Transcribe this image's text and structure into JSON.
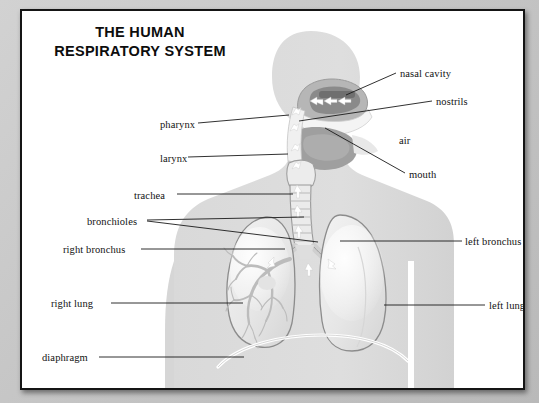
{
  "title": {
    "line1": "THE HUMAN",
    "line2": "RESPIRATORY SYSTEM"
  },
  "diagram": {
    "silhouette": "grey human head-and-torso figure facing right",
    "colors": {
      "frame_border": "#151515",
      "page_background": "#ffffff",
      "outer_margin": "#c9c9c9",
      "body_silhouette": "#dcdcdc",
      "organ_fill": "#eeeeee",
      "organ_outline": "#8c8c8c",
      "nasal_cavity_dark": "#8a8a8a",
      "leader_line": "#1a1a1a",
      "airflow_arrow": "#ffffff",
      "label_text": "#121212",
      "title_text": "#0d0d0d"
    }
  },
  "labels": {
    "left": [
      {
        "name": "pharynx",
        "text": "pharynx",
        "x": 138,
        "y": 115
      },
      {
        "name": "larynx",
        "text": "larynx",
        "x": 138,
        "y": 149
      },
      {
        "name": "trachea",
        "text": "trachea",
        "x": 118,
        "y": 186
      },
      {
        "name": "bronchioles",
        "text": "bronchioles",
        "x": 74,
        "y": 215
      },
      {
        "name": "right-bronchus",
        "text": "right bronchus",
        "x": 50,
        "y": 242
      },
      {
        "name": "right-lung",
        "text": "right lung",
        "x": 37,
        "y": 296
      },
      {
        "name": "diaphragm",
        "text": "diaphragm",
        "x": 28,
        "y": 350
      }
    ],
    "right": [
      {
        "name": "nasal-cavity",
        "text": "nasal cavity",
        "x": 379,
        "y": 67
      },
      {
        "name": "nostrils",
        "text": "nostrils",
        "x": 415,
        "y": 93
      },
      {
        "name": "air",
        "text": "air",
        "x": 378,
        "y": 131
      },
      {
        "name": "mouth",
        "text": "mouth",
        "x": 388,
        "y": 167
      },
      {
        "name": "left-bronchus",
        "text": "left bronchus",
        "x": 447,
        "y": 233
      },
      {
        "name": "left-lung",
        "text": "left lung",
        "x": 471,
        "y": 298
      }
    ]
  }
}
